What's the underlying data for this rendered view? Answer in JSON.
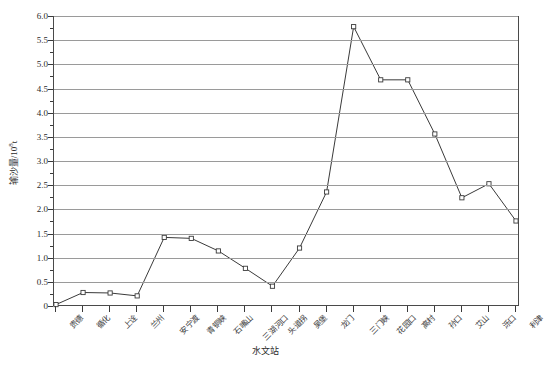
{
  "chart_data": {
    "type": "line",
    "title": "",
    "xlabel": "水文站",
    "ylabel": "输沙量/10⁸t",
    "ylabel_main": "输沙量/10",
    "ylabel_exp": "8",
    "ylabel_unit": "t",
    "ylim": [
      0,
      6.0
    ],
    "ytick_step": 0.5,
    "yticks": [
      "0",
      "0.5",
      "1.0",
      "1.5",
      "2.0",
      "2.5",
      "3.0",
      "3.5",
      "4.0",
      "4.5",
      "5.0",
      "5.5",
      "6.0"
    ],
    "grid": true,
    "legend": "none",
    "marker": "open-square",
    "line_color": "#3a3a3a",
    "grid_color": "#9a9a9a",
    "frame_color": "#4a4a4a",
    "categories": [
      "贵德",
      "循化",
      "上诠",
      "兰州",
      "安宁渡",
      "青铜峡",
      "石嘴山",
      "三湖河口",
      "头道拐",
      "吴堡",
      "龙门",
      "三门峡",
      "花园口",
      "高村",
      "孙口",
      "艾山",
      "泺口",
      "利津"
    ],
    "series": [
      {
        "name": "输沙量",
        "values": [
          0.05,
          0.3,
          0.29,
          0.23,
          1.44,
          1.42,
          1.16,
          0.8,
          0.43,
          1.22,
          2.38,
          5.8,
          4.7,
          4.7,
          3.58,
          2.26,
          2.55,
          1.78
        ]
      }
    ],
    "points": [
      {
        "station": "贵德",
        "value": 0.05
      },
      {
        "station": "循化",
        "value": 0.3
      },
      {
        "station": "上诠",
        "value": 0.29
      },
      {
        "station": "兰州",
        "value": 0.23
      },
      {
        "station": "安宁渡",
        "value": 1.44
      },
      {
        "station": "青铜峡",
        "value": 1.42
      },
      {
        "station": "石嘴山",
        "value": 1.16
      },
      {
        "station": "三湖河口",
        "value": 0.8
      },
      {
        "station": "头道拐",
        "value": 0.43
      },
      {
        "station": "吴堡",
        "value": 1.22
      },
      {
        "station": "龙门",
        "value": 2.38
      },
      {
        "station": "三门峡",
        "value": 5.8
      },
      {
        "station": "花园口",
        "value": 4.7
      },
      {
        "station": "高村",
        "value": 4.7
      },
      {
        "station": "孙口",
        "value": 3.58
      },
      {
        "station": "艾山",
        "value": 2.26
      },
      {
        "station": "泺口",
        "value": 2.55
      },
      {
        "station": "利津",
        "value": 1.78
      }
    ]
  },
  "caption": ""
}
